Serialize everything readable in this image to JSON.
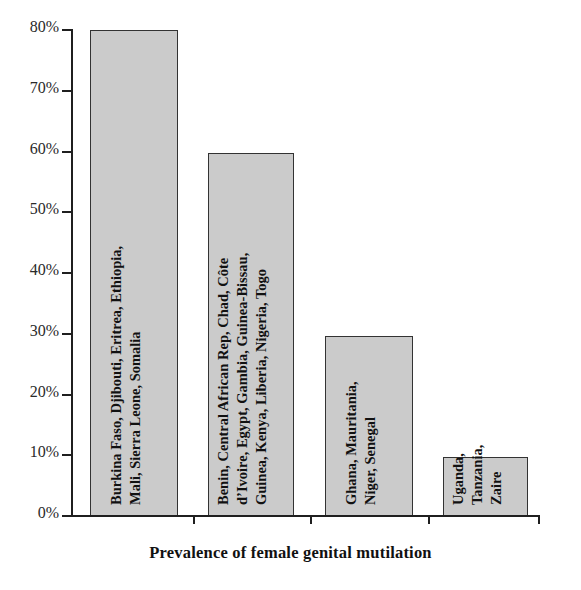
{
  "chart_data": {
    "type": "bar",
    "title": "",
    "xlabel": "Prevalence of female genital mutilation",
    "ylabel": "",
    "ylim": [
      0,
      80
    ],
    "ytick_labels": [
      "0%",
      "10%",
      "20%",
      "30%",
      "40%",
      "50%",
      "60%",
      "70%",
      "80%"
    ],
    "ytick_values": [
      0,
      10,
      20,
      30,
      40,
      50,
      60,
      70,
      80
    ],
    "grid": false,
    "legend": "none",
    "bar_color": "#cbcbcb",
    "bar_edge_color": "#333333",
    "axis_color": "#1f1f1f",
    "categories": [
      "Burkina Faso, Djibouti, Eritrea, Ethiopia, Mali, Sierra Leone, Somalia",
      "Benin, Central African Rep, Chad, Côte d’Ivoire, Egypt, Gambia, Guinea-Bissau, Guinea, Kenya, Liberia, Nigeria, Togo",
      "Ghana, Mauritania, Niger, Senegal",
      "Uganda, Tanzania, Zaire"
    ],
    "values": [
      80,
      59.7,
      29.7,
      9.7
    ],
    "bars": [
      {
        "value": 80,
        "label_lines": [
          "Burkina Faso, Djibouti, Eritrea, Ethiopia,",
          "Mali, Sierra Leone, Somalia"
        ]
      },
      {
        "value": 59.7,
        "label_lines": [
          "Benin, Central African Rep, Chad, Côte",
          "d’Ivoire, Egypt, Gambia, Guinea-Bissau,",
          "Guinea, Kenya, Liberia, Nigeria, Togo"
        ]
      },
      {
        "value": 29.7,
        "label_lines": [
          "Ghana, Mauritania,",
          "Niger, Senegal"
        ]
      },
      {
        "value": 9.7,
        "label_lines": [
          "Uganda,",
          "Tanzania,",
          "Zaire"
        ]
      }
    ]
  }
}
